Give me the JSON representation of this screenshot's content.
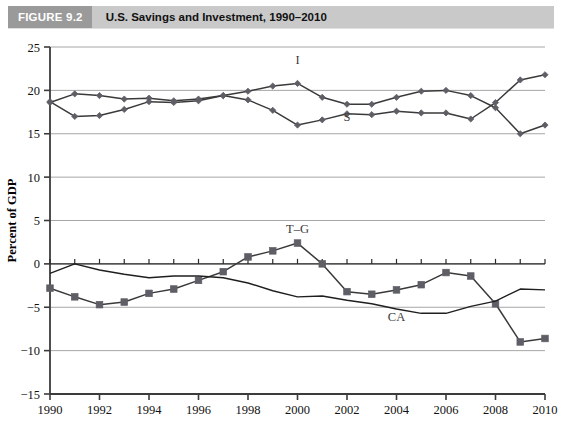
{
  "figure": {
    "tag": "FIGURE 9.2",
    "title": "U.S. Savings and Investment, 1990–2010"
  },
  "colors": {
    "header_band": "#c9c9c9",
    "header_tag": "#9a9a9a",
    "header_tag_text": "#ffffff",
    "gridline": "#a6a6a6",
    "axis": "#3b3b3b",
    "series_marker": "#5e5e66",
    "series_line": "#3a3a3a",
    "plain_line": "#1f1f1f",
    "label_text": "#3a3a3a"
  },
  "chart_data": {
    "type": "line",
    "title": "U.S. Savings and Investment, 1990–2010",
    "xlabel": "",
    "ylabel": "Percent of GDP",
    "xlim": [
      1990,
      2010
    ],
    "ylim": [
      -15,
      25
    ],
    "ytick_step": 5,
    "xtick_step": 2,
    "yticks": [
      25,
      20,
      15,
      10,
      5,
      0,
      -5,
      -10,
      -15
    ],
    "xticks": [
      1990,
      1992,
      1994,
      1996,
      1998,
      2000,
      2002,
      2004,
      2006,
      2008,
      2010
    ],
    "xtick_labels": [
      "1990",
      "1992",
      "1994",
      "1996",
      "1998",
      "2000",
      "2002",
      "2004",
      "2006",
      "2008",
      "2010"
    ],
    "ytick_labels": [
      "25",
      "20",
      "15",
      "10",
      "5",
      "0",
      "−5",
      "−10",
      "−15"
    ],
    "grid": true,
    "grid_axis": "y",
    "legend": "inline-annotations",
    "x": [
      1990,
      1991,
      1992,
      1993,
      1994,
      1995,
      1996,
      1997,
      1998,
      1999,
      2000,
      2001,
      2002,
      2003,
      2004,
      2005,
      2006,
      2007,
      2008,
      2009,
      2010
    ],
    "series": [
      {
        "name": "I",
        "label": "I",
        "description": "Investment",
        "marker": "diamond",
        "label_x": 2000,
        "label_y": 23.0,
        "values": [
          18.7,
          17.0,
          17.1,
          17.8,
          18.7,
          18.6,
          18.8,
          19.4,
          19.9,
          20.5,
          20.8,
          19.2,
          18.4,
          18.4,
          19.2,
          19.9,
          20.0,
          19.4,
          18.0,
          15.0,
          16.0
        ]
      },
      {
        "name": "S",
        "label": "S",
        "description": "Savings",
        "marker": "diamond",
        "label_x": 2002,
        "label_y": 16.5,
        "values": [
          18.6,
          19.6,
          19.4,
          19.0,
          19.1,
          18.8,
          19.0,
          19.4,
          18.9,
          17.7,
          16.0,
          16.6,
          17.3,
          17.2,
          17.6,
          17.4,
          17.4,
          16.7,
          18.6,
          21.2,
          21.8
        ]
      },
      {
        "name": "T–G",
        "label": "T–G",
        "description": "Government budget balance",
        "marker": "square",
        "label_x": 2000,
        "label_y": 3.6,
        "values": [
          -2.8,
          -3.8,
          -4.7,
          -4.4,
          -3.4,
          -2.9,
          -1.9,
          -0.9,
          0.8,
          1.5,
          2.4,
          0.0,
          -3.2,
          -3.5,
          -3.0,
          -2.4,
          -1.0,
          -1.4,
          -4.6,
          -9.0,
          -8.6
        ]
      },
      {
        "name": "CA",
        "label": "CA",
        "description": "Current account balance",
        "marker": "none",
        "label_x": 2004,
        "label_y": -6.6,
        "values": [
          -1.1,
          0.0,
          -0.7,
          -1.2,
          -1.6,
          -1.4,
          -1.4,
          -1.6,
          -2.2,
          -3.1,
          -3.8,
          -3.7,
          -4.2,
          -4.6,
          -5.2,
          -5.7,
          -5.7,
          -4.9,
          -4.3,
          -2.9,
          -3.0
        ]
      }
    ]
  }
}
